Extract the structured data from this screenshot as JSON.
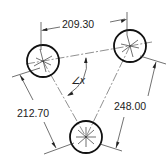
{
  "drawing": {
    "type": "hole-pattern-dimension-drawing",
    "holes": [
      {
        "id": "A",
        "position": "top-left",
        "cx": 43,
        "cy": 61,
        "r": 16
      },
      {
        "id": "B",
        "position": "top-right",
        "cx": 130,
        "cy": 46,
        "r": 16
      },
      {
        "id": "C",
        "position": "bottom",
        "cx": 86,
        "cy": 137,
        "r": 16
      }
    ],
    "dimensions": {
      "top_horizontal": "209.30",
      "left_slanted": "212.70",
      "right_slanted": "248.00"
    },
    "angle_label": "∠x",
    "colors": {
      "line": "#222222",
      "background": "#ffffff"
    }
  }
}
